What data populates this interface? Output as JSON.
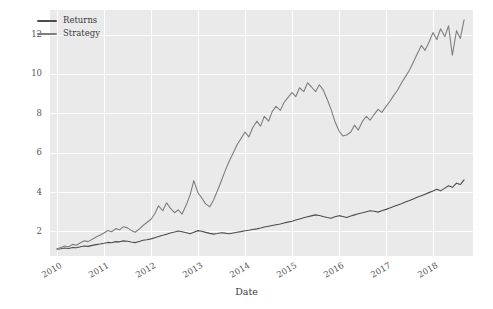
{
  "chart_data": {
    "type": "line",
    "title": "",
    "xlabel": "Date",
    "ylabel": "",
    "grid": true,
    "legend_position": "upper-left",
    "xlim": [
      2009.85,
      2018.85
    ],
    "ylim": [
      0.75,
      13.25
    ],
    "xticks": [
      "2010",
      "2011",
      "2012",
      "2013",
      "2014",
      "2015",
      "2016",
      "2017",
      "2018"
    ],
    "xtick_values": [
      2010,
      2011,
      2012,
      2013,
      2014,
      2015,
      2016,
      2017,
      2018
    ],
    "yticks": [
      "2",
      "4",
      "6",
      "8",
      "10",
      "12"
    ],
    "ytick_values": [
      2,
      4,
      6,
      8,
      10,
      12
    ],
    "series": [
      {
        "name": "Returns",
        "color": "#4c4c4c",
        "x": [
          2010.0,
          2010.08,
          2010.16,
          2010.25,
          2010.33,
          2010.41,
          2010.5,
          2010.58,
          2010.66,
          2010.75,
          2010.83,
          2010.91,
          2011.0,
          2011.08,
          2011.16,
          2011.25,
          2011.33,
          2011.41,
          2011.5,
          2011.58,
          2011.66,
          2011.75,
          2011.83,
          2011.91,
          2012.0,
          2012.08,
          2012.16,
          2012.25,
          2012.33,
          2012.41,
          2012.5,
          2012.58,
          2012.66,
          2012.75,
          2012.83,
          2012.91,
          2013.0,
          2013.08,
          2013.16,
          2013.25,
          2013.33,
          2013.41,
          2013.5,
          2013.58,
          2013.66,
          2013.75,
          2013.83,
          2013.91,
          2014.0,
          2014.08,
          2014.16,
          2014.25,
          2014.33,
          2014.41,
          2014.5,
          2014.58,
          2014.66,
          2014.75,
          2014.83,
          2014.91,
          2015.0,
          2015.08,
          2015.16,
          2015.25,
          2015.33,
          2015.41,
          2015.5,
          2015.58,
          2015.66,
          2015.75,
          2015.83,
          2015.91,
          2016.0,
          2016.08,
          2016.16,
          2016.25,
          2016.33,
          2016.41,
          2016.5,
          2016.58,
          2016.66,
          2016.75,
          2016.83,
          2016.91,
          2017.0,
          2017.08,
          2017.16,
          2017.25,
          2017.33,
          2017.41,
          2017.5,
          2017.58,
          2017.66,
          2017.75,
          2017.83,
          2017.91,
          2018.0,
          2018.08,
          2018.16,
          2018.25,
          2018.33,
          2018.41,
          2018.5,
          2018.58,
          2018.66
        ],
        "y": [
          1.1,
          1.12,
          1.16,
          1.13,
          1.18,
          1.17,
          1.22,
          1.26,
          1.24,
          1.29,
          1.33,
          1.36,
          1.4,
          1.44,
          1.42,
          1.48,
          1.47,
          1.52,
          1.5,
          1.46,
          1.43,
          1.49,
          1.55,
          1.58,
          1.62,
          1.68,
          1.74,
          1.8,
          1.86,
          1.92,
          1.97,
          2.02,
          1.98,
          1.93,
          1.88,
          1.96,
          2.04,
          2.01,
          1.95,
          1.9,
          1.86,
          1.89,
          1.93,
          1.91,
          1.88,
          1.92,
          1.96,
          1.99,
          2.03,
          2.06,
          2.1,
          2.13,
          2.17,
          2.22,
          2.26,
          2.3,
          2.34,
          2.38,
          2.43,
          2.47,
          2.52,
          2.58,
          2.63,
          2.69,
          2.74,
          2.79,
          2.84,
          2.81,
          2.76,
          2.71,
          2.67,
          2.74,
          2.8,
          2.76,
          2.71,
          2.78,
          2.84,
          2.9,
          2.95,
          3.0,
          3.05,
          3.02,
          2.98,
          3.05,
          3.12,
          3.19,
          3.26,
          3.34,
          3.41,
          3.49,
          3.57,
          3.65,
          3.73,
          3.81,
          3.89,
          3.97,
          4.05,
          4.14,
          4.06,
          4.2,
          4.32,
          4.24,
          4.45,
          4.38,
          4.62
        ]
      },
      {
        "name": "Strategy",
        "color": "#7f7f7f",
        "x": [
          2010.0,
          2010.08,
          2010.16,
          2010.25,
          2010.33,
          2010.41,
          2010.5,
          2010.58,
          2010.66,
          2010.75,
          2010.83,
          2010.91,
          2011.0,
          2011.08,
          2011.16,
          2011.25,
          2011.33,
          2011.41,
          2011.5,
          2011.58,
          2011.66,
          2011.75,
          2011.83,
          2011.91,
          2012.0,
          2012.08,
          2012.16,
          2012.25,
          2012.33,
          2012.41,
          2012.5,
          2012.58,
          2012.66,
          2012.75,
          2012.83,
          2012.91,
          2013.0,
          2013.08,
          2013.16,
          2013.25,
          2013.33,
          2013.41,
          2013.5,
          2013.58,
          2013.66,
          2013.75,
          2013.83,
          2013.91,
          2014.0,
          2014.08,
          2014.16,
          2014.25,
          2014.33,
          2014.41,
          2014.5,
          2014.58,
          2014.66,
          2014.75,
          2014.83,
          2014.91,
          2015.0,
          2015.08,
          2015.16,
          2015.25,
          2015.33,
          2015.41,
          2015.5,
          2015.58,
          2015.66,
          2015.75,
          2015.83,
          2015.91,
          2016.0,
          2016.08,
          2016.16,
          2016.25,
          2016.33,
          2016.41,
          2016.5,
          2016.58,
          2016.66,
          2016.75,
          2016.83,
          2016.91,
          2017.0,
          2017.08,
          2017.16,
          2017.25,
          2017.33,
          2017.41,
          2017.5,
          2017.58,
          2017.66,
          2017.75,
          2017.83,
          2017.91,
          2018.0,
          2018.08,
          2018.16,
          2018.25,
          2018.33,
          2018.41,
          2018.5,
          2018.58,
          2018.66
        ],
        "y": [
          1.12,
          1.18,
          1.26,
          1.22,
          1.34,
          1.3,
          1.42,
          1.52,
          1.48,
          1.6,
          1.72,
          1.8,
          1.92,
          2.05,
          1.98,
          2.14,
          2.08,
          2.24,
          2.18,
          2.05,
          1.96,
          2.12,
          2.3,
          2.45,
          2.62,
          2.9,
          3.3,
          3.05,
          3.45,
          3.18,
          2.95,
          3.1,
          2.88,
          3.35,
          3.85,
          4.58,
          3.95,
          3.7,
          3.4,
          3.25,
          3.6,
          4.05,
          4.6,
          5.1,
          5.55,
          6.0,
          6.4,
          6.7,
          7.05,
          6.8,
          7.25,
          7.6,
          7.35,
          7.85,
          7.6,
          8.1,
          8.35,
          8.15,
          8.55,
          8.8,
          9.05,
          8.85,
          9.3,
          9.1,
          9.55,
          9.35,
          9.1,
          9.45,
          9.2,
          8.7,
          8.2,
          7.6,
          7.1,
          6.85,
          6.9,
          7.05,
          7.4,
          7.15,
          7.6,
          7.85,
          7.65,
          7.95,
          8.2,
          8.05,
          8.35,
          8.6,
          8.9,
          9.2,
          9.55,
          9.85,
          10.2,
          10.6,
          11.0,
          11.45,
          11.2,
          11.6,
          12.1,
          11.75,
          12.3,
          11.9,
          12.45,
          10.95,
          12.2,
          11.8,
          12.75
        ]
      }
    ]
  },
  "legend": {
    "entries": [
      {
        "label": "Returns"
      },
      {
        "label": "Strategy"
      }
    ]
  },
  "axes": {
    "xlabel": "Date"
  },
  "style": {
    "plot_background": "#eaeaea",
    "figure_background": "#ffffff",
    "gridline_color": "#ffffff",
    "tick_text_color": "#555555",
    "label_text_color": "#3b3b3b"
  }
}
